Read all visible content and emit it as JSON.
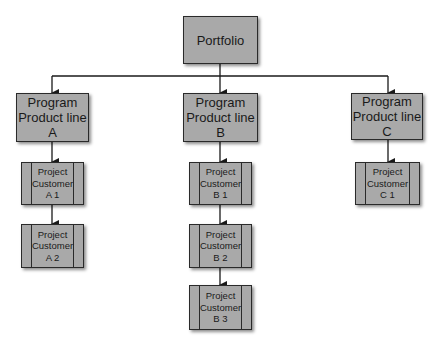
{
  "diagram": {
    "type": "hierarchy",
    "root": {
      "label": "Portfolio"
    },
    "programs": [
      {
        "label": "Program\nProduct line\nA",
        "projects": [
          {
            "label": "Project\nCustomer\nA 1"
          },
          {
            "label": "Project\nCustomer\nA 2"
          }
        ]
      },
      {
        "label": "Program\nProduct line\nB",
        "projects": [
          {
            "label": "Project\nCustomer\nB 1"
          },
          {
            "label": "Project\nCustomer\nB 2"
          },
          {
            "label": "Project\nCustomer\nB 3"
          }
        ]
      },
      {
        "label": "Program\nProduct line\nC",
        "projects": [
          {
            "label": "Project\nCustomer\nC 1"
          }
        ]
      }
    ],
    "colors": {
      "box_fill": "#a9a9a9",
      "stroke": "#2a2a2a",
      "background": "#ffffff"
    }
  }
}
